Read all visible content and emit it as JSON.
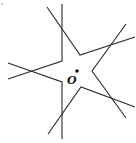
{
  "diagram": {
    "type": "geometry-figure",
    "center_point": {
      "label": "O",
      "x": 77,
      "y": 71
    },
    "label_position": {
      "x": 67,
      "y": 84
    },
    "stroke_color": "#2b2b2b",
    "polylines": [
      {
        "name": "top-vertical-to-left-upper",
        "points": "62,4 62,61 8,79"
      },
      {
        "name": "top-diagonal-to-right-upper",
        "points": "47,7 80,55 135,37"
      },
      {
        "name": "right-upper-to-right-lower",
        "points": "126,24 92,71 126,118"
      },
      {
        "name": "right-lower-to-bottom-diagonal",
        "points": "135,107 81,87 48,134"
      },
      {
        "name": "bottom-vertical-to-left-lower",
        "points": "62,139 62,82 8,63"
      }
    ],
    "stray_mark": {
      "x": 2,
      "y": 4
    }
  }
}
